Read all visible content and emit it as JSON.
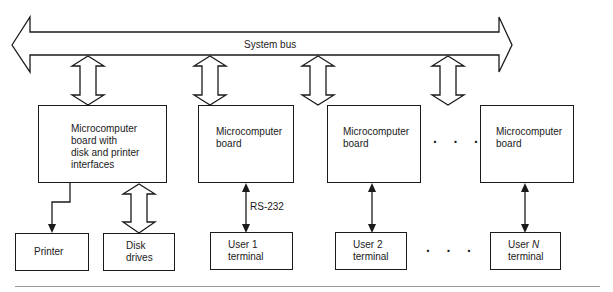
{
  "diagram": {
    "bus": {
      "label": "System bus"
    },
    "boards": [
      {
        "id": "board-1",
        "label": "Microcomputer\nboard with\ndisk and printer\ninterfaces"
      },
      {
        "id": "board-2",
        "label": "Microcomputer\nboard"
      },
      {
        "id": "board-3",
        "label": "Microcomputer\nboard"
      },
      {
        "id": "board-n",
        "label": "Microcomputer\nboard"
      }
    ],
    "peripherals": [
      {
        "id": "printer",
        "label": "Printer"
      },
      {
        "id": "disk-drives",
        "label": "Disk\ndrives"
      },
      {
        "id": "user-1-terminal",
        "label": "User 1\nterminal"
      },
      {
        "id": "user-2-terminal",
        "label": "User 2\nterminal"
      },
      {
        "id": "user-n-terminal",
        "label_prefix": "User ",
        "label_var": "N",
        "label_suffix": "terminal"
      }
    ],
    "link_label": "RS-232",
    "ellipsis": "· · ·"
  }
}
